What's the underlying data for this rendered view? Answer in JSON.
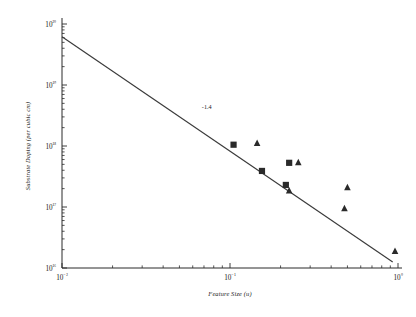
{
  "chart_data": {
    "type": "scatter",
    "title": "",
    "xlabel": "Feature Size (u)",
    "ylabel": "Substrate Doping (per cubic cm)",
    "xscale": "log",
    "yscale": "log",
    "xlim": [
      0.01,
      1.0
    ],
    "ylim": [
      1e+16,
      1e+20
    ],
    "grid": false,
    "legend": "none",
    "xtick_labels": [
      "10⁻²",
      "10⁻¹",
      "10⁰"
    ],
    "xtick_values": [
      0.01,
      0.1,
      1.0
    ],
    "ytick_labels": [
      "10¹⁶",
      "10¹⁷",
      "10¹⁸",
      "10¹⁹",
      "10²⁰"
    ],
    "ytick_values": [
      1e+16,
      1e+17,
      1e+18,
      1e+19,
      1e+20
    ],
    "annotations": [
      {
        "text": "-1.4",
        "x": 0.068,
        "y": 4e+18,
        "meaning": "slope-of-trend-line"
      }
    ],
    "series": [
      {
        "name": "square-markers",
        "marker": "square",
        "color": "#2a2a2a",
        "points": [
          {
            "x": 0.105,
            "y": 1.05e+18
          },
          {
            "x": 0.155,
            "y": 3.9e+17
          },
          {
            "x": 0.215,
            "y": 2.3e+17
          },
          {
            "x": 0.225,
            "y": 5.3e+17
          }
        ]
      },
      {
        "name": "triangle-markers",
        "marker": "triangle",
        "color": "#2a2a2a",
        "points": [
          {
            "x": 0.145,
            "y": 1.12e+18
          },
          {
            "x": 0.225,
            "y": 1.85e+17
          },
          {
            "x": 0.255,
            "y": 5.4e+17
          },
          {
            "x": 0.5,
            "y": 2.1e+17
          },
          {
            "x": 0.48,
            "y": 9.5e+16
          },
          {
            "x": 0.96,
            "y": 1.9e+16
          }
        ]
      }
    ],
    "trend_line": {
      "name": "power-law-fit",
      "slope": -1.4,
      "x_start": 0.01,
      "y_start": 6.2e+19,
      "x_end": 0.93,
      "y_end": 1.25e+16
    }
  },
  "axes": {
    "x_title": "Feature Size (u)",
    "y_title": "Substrate Doping (per cubic cm)"
  }
}
